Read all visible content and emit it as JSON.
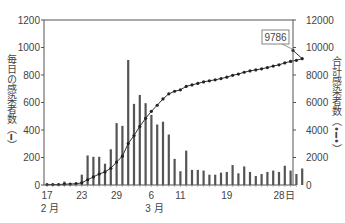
{
  "chart_data": {
    "type": "bar+line",
    "title": "",
    "left_axis": {
      "label": "毎日の感染者数（━）",
      "ylim": [
        0,
        1200
      ],
      "ticks": [
        0,
        200,
        400,
        600,
        800,
        1000,
        1200
      ]
    },
    "right_axis": {
      "label": "合計感染者数（•━•）",
      "ylim": [
        0,
        12000
      ],
      "ticks": [
        0,
        2000,
        4000,
        6000,
        8000,
        10000,
        12000
      ]
    },
    "x_tick_labels": [
      {
        "day_index": 0,
        "label": "17"
      },
      {
        "day_index": 6,
        "label": "23"
      },
      {
        "day_index": 12,
        "label": "29"
      },
      {
        "day_index": 18,
        "label": "6"
      },
      {
        "day_index": 23,
        "label": "11"
      },
      {
        "day_index": 31,
        "label": "19"
      },
      {
        "day_index": 40,
        "label": "28"
      },
      {
        "day_index": 43,
        "label": "日"
      }
    ],
    "month_labels": [
      {
        "day_index": 0,
        "label": "2 月"
      },
      {
        "day_index": 18,
        "label": "3 月"
      }
    ],
    "start_date": "2/17",
    "series": [
      {
        "name": "毎日の感染者数",
        "type": "bar",
        "axis": "left",
        "values": [
          2,
          0,
          3,
          25,
          10,
          20,
          75,
          215,
          205,
          205,
          155,
          260,
          450,
          430,
          909,
          590,
          655,
          595,
          510,
          440,
          460,
          367,
          190,
          100,
          250,
          110,
          110,
          105,
          75,
          75,
          90,
          95,
          145,
          85,
          135,
          95,
          65,
          80,
          95,
          105,
          95,
          140,
          105,
          80,
          120
        ]
      },
      {
        "name": "合計感染者数",
        "type": "line",
        "axis": "right",
        "values": [
          30,
          30,
          35,
          60,
          70,
          90,
          160,
          380,
          590,
          800,
          950,
          1220,
          1670,
          2100,
          3010,
          3600,
          4260,
          4850,
          5360,
          5800,
          6260,
          6630,
          6820,
          6920,
          7170,
          7280,
          7390,
          7500,
          7580,
          7650,
          7740,
          7840,
          7980,
          8070,
          8200,
          8300,
          8370,
          8450,
          8540,
          8650,
          8740,
          8880,
          8990,
          9070,
          9190,
          9786
        ]
      }
    ],
    "annotation": {
      "label": "9786"
    },
    "grid": false,
    "legend": "none (axis labels carry line-style markers)"
  }
}
